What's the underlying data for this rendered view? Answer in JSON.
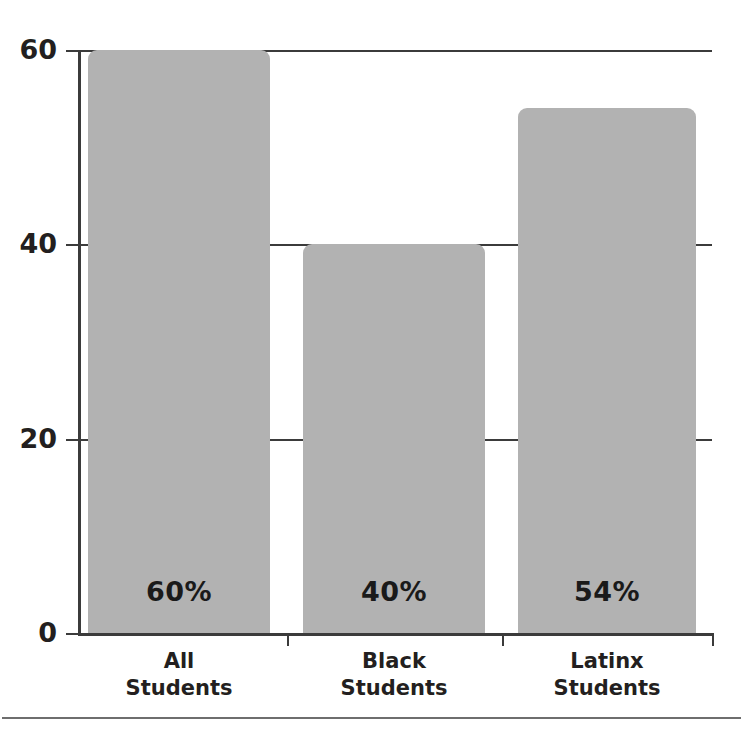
{
  "chart_data": {
    "type": "bar",
    "title": "",
    "subtitle": "",
    "xlabel": "",
    "ylabel": "",
    "categories": [
      "All Students",
      "Black Students",
      "Latinx Students"
    ],
    "category_lines": [
      [
        "All",
        "Students"
      ],
      [
        "Black",
        "Students"
      ],
      [
        "Latinx",
        "Students"
      ]
    ],
    "values": [
      60,
      40,
      54
    ],
    "value_labels": [
      "60%",
      "40%",
      "54%"
    ],
    "series": [
      {
        "name": "Percent",
        "values": [
          60,
          40,
          54
        ]
      }
    ],
    "ylim": [
      0,
      60
    ],
    "ytick_values": [
      0,
      20,
      40,
      60
    ],
    "ytick_labels": [
      "0",
      "20",
      "40",
      "60"
    ],
    "grid": true,
    "grid_axis": "y",
    "legend": false,
    "legend_position": "none",
    "bar_color": "#b2b2b2",
    "axis_color": "#3b3b3b",
    "text_color": "#231f20",
    "value_label_color": "#1a1a1a",
    "units": "percent",
    "annotations": []
  },
  "figure": {
    "title_sliver": "",
    "bottom_rule_color": "#6e6e6e",
    "background": "#ffffff"
  }
}
